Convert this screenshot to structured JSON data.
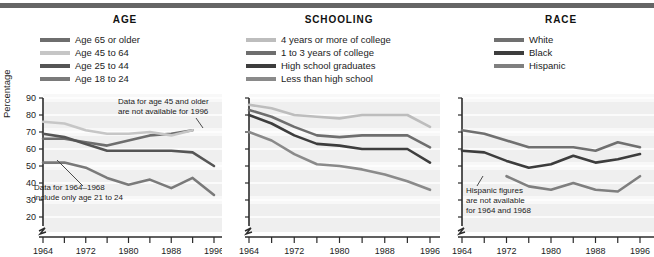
{
  "figure": {
    "panels": [
      {
        "title": "AGE",
        "legend": [
          {
            "label": "Age 65 or older",
            "color": "#6e6e6e"
          },
          {
            "label": "Age 45 to 64",
            "color": "#c6c6c6"
          },
          {
            "label": "Age 25 to 44",
            "color": "#555555"
          },
          {
            "label": "Age 18 to 24",
            "color": "#7a7a7a"
          }
        ],
        "annotations": [
          {
            "text_lines": [
              "Data for age 45 and older",
              "are not available for 1996"
            ],
            "x": 118,
            "y": 104
          },
          {
            "text_lines": [
              "Data for 1964–1968",
              "include only age 21 to 24"
            ],
            "x": 34,
            "y": 190
          }
        ]
      },
      {
        "title": "SCHOOLING",
        "legend": [
          {
            "label": "4 years or more of college",
            "color": "#bdbdbd"
          },
          {
            "label": "1 to 3 years of college",
            "color": "#6e6e6e"
          },
          {
            "label": "High school graduates",
            "color": "#3d3d3d"
          },
          {
            "label": "Less than high school",
            "color": "#8a8a8a"
          }
        ],
        "annotations": []
      },
      {
        "title": "RACE",
        "legend": [
          {
            "label": "White",
            "color": "#707070"
          },
          {
            "label": "Black",
            "color": "#3d3d3d"
          },
          {
            "label": "Hispanic",
            "color": "#7f7f7f"
          }
        ],
        "annotations": [
          {
            "text_lines": [
              "Hispanic figures",
              "are not available",
              "for 1964 and 1968"
            ],
            "x": 466,
            "y": 193
          }
        ]
      }
    ]
  },
  "chart_data": [
    {
      "type": "line",
      "title": "AGE",
      "xlabel": "",
      "ylabel": "Percentage",
      "x": [
        1964,
        1968,
        1972,
        1976,
        1980,
        1984,
        1988,
        1992,
        1996
      ],
      "xticks": [
        1964,
        1968,
        1972,
        1976,
        1980,
        1984,
        1988,
        1992,
        1996
      ],
      "xticklabels": [
        "1964",
        "",
        "1972",
        "",
        "1980",
        "",
        "1988",
        "",
        "1996"
      ],
      "xlim": [
        1964,
        1996
      ],
      "ylim": [
        20,
        90
      ],
      "yticks": [
        20,
        30,
        40,
        50,
        60,
        70,
        80,
        90
      ],
      "axis_break": true,
      "grid": true,
      "legend_position": "above",
      "series": [
        {
          "name": "Age 65 or older",
          "color": "#6e6e6e",
          "values": [
            66,
            66,
            64,
            62,
            65,
            68,
            69,
            71,
            null
          ]
        },
        {
          "name": "Age 45 to 64",
          "color": "#c6c6c6",
          "values": [
            76,
            75,
            71,
            69,
            69,
            70,
            68,
            71,
            null
          ]
        },
        {
          "name": "Age 25 to 44",
          "color": "#555555",
          "values": [
            69,
            67,
            63,
            59,
            59,
            59,
            59,
            58,
            50
          ]
        },
        {
          "name": "Age 18 to 24",
          "color": "#7a7a7a",
          "values": [
            52,
            52,
            49,
            43,
            39,
            42,
            37,
            43,
            33
          ]
        }
      ]
    },
    {
      "type": "line",
      "title": "SCHOOLING",
      "xlabel": "",
      "ylabel": "",
      "x": [
        1964,
        1968,
        1972,
        1976,
        1980,
        1984,
        1988,
        1992,
        1996
      ],
      "xticks": [
        1964,
        1968,
        1972,
        1976,
        1980,
        1984,
        1988,
        1992,
        1996
      ],
      "xticklabels": [
        "1964",
        "",
        "1972",
        "",
        "1980",
        "",
        "1988",
        "",
        "1996"
      ],
      "xlim": [
        1964,
        1996
      ],
      "ylim": [
        20,
        90
      ],
      "yticks": [
        20,
        30,
        40,
        50,
        60,
        70,
        80,
        90
      ],
      "axis_break": true,
      "grid": true,
      "legend_position": "above",
      "series": [
        {
          "name": "4 years or more of college",
          "color": "#bdbdbd",
          "values": [
            86,
            84,
            80,
            79,
            78,
            80,
            80,
            80,
            73
          ]
        },
        {
          "name": "1 to 3 years of college",
          "color": "#6e6e6e",
          "values": [
            83,
            79,
            73,
            68,
            67,
            68,
            68,
            68,
            61
          ]
        },
        {
          "name": "High school graduates",
          "color": "#3d3d3d",
          "values": [
            80,
            75,
            68,
            63,
            62,
            60,
            60,
            60,
            52
          ]
        },
        {
          "name": "Less than high school",
          "color": "#8a8a8a",
          "values": [
            70,
            65,
            57,
            51,
            50,
            48,
            45,
            41,
            36
          ]
        }
      ]
    },
    {
      "type": "line",
      "title": "RACE",
      "xlabel": "",
      "ylabel": "",
      "x": [
        1964,
        1968,
        1972,
        1976,
        1980,
        1984,
        1988,
        1992,
        1996
      ],
      "xticks": [
        1964,
        1968,
        1972,
        1976,
        1980,
        1984,
        1988,
        1992,
        1996
      ],
      "xticklabels": [
        "1964",
        "",
        "1972",
        "",
        "1980",
        "",
        "1988",
        "",
        "1996"
      ],
      "xlim": [
        1964,
        1996
      ],
      "ylim": [
        20,
        90
      ],
      "yticks": [
        20,
        30,
        40,
        50,
        60,
        70,
        80,
        90
      ],
      "axis_break": true,
      "grid": true,
      "legend_position": "above",
      "series": [
        {
          "name": "White",
          "color": "#707070",
          "values": [
            71,
            69,
            65,
            61,
            61,
            61,
            59,
            64,
            61
          ]
        },
        {
          "name": "Black",
          "color": "#3d3d3d",
          "values": [
            59,
            58,
            53,
            49,
            51,
            56,
            52,
            54,
            57
          ]
        },
        {
          "name": "Hispanic",
          "color": "#7f7f7f",
          "values": [
            null,
            null,
            44,
            38,
            36,
            40,
            36,
            35,
            44
          ]
        }
      ]
    }
  ]
}
